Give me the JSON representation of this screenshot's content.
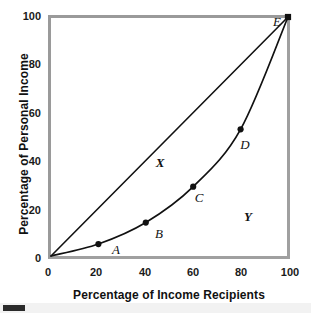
{
  "figure": {
    "background_color": "#ffffff",
    "frame_color": "#a0a0a0",
    "ink_color": "#111111"
  },
  "chart_data": {
    "type": "line",
    "title": "",
    "xlabel": "Percentage of Income Recipients",
    "ylabel": "Percentage of Personal Income",
    "xlim": [
      0,
      100
    ],
    "ylim": [
      0,
      100
    ],
    "xticks": [
      0,
      20,
      40,
      60,
      80,
      100
    ],
    "yticks": [
      0,
      20,
      40,
      60,
      80,
      100
    ],
    "xtick_labels": [
      "0",
      "20",
      "40",
      "60",
      "80",
      "100"
    ],
    "ytick_labels": [
      "0",
      "20",
      "40",
      "60",
      "80",
      "100"
    ],
    "grid": false,
    "legend": "none",
    "series": [
      {
        "name": "Line of equality",
        "style": "straight-line",
        "markers": false,
        "x": [
          0,
          100
        ],
        "y": [
          0,
          100
        ],
        "values": [
          0,
          100
        ]
      },
      {
        "name": "Lorenz curve",
        "style": "curve-with-markers",
        "markers": true,
        "x": [
          0,
          20,
          40,
          60,
          80,
          100
        ],
        "y": [
          0,
          5,
          14,
          29,
          53,
          100
        ],
        "values": [
          0,
          5,
          14,
          29,
          53,
          100
        ],
        "point_labels": [
          "",
          "A",
          "B",
          "C",
          "D",
          "E"
        ]
      }
    ],
    "points": [
      {
        "label": "A",
        "x": 20,
        "y": 5
      },
      {
        "label": "B",
        "x": 40,
        "y": 14
      },
      {
        "label": "C",
        "x": 60,
        "y": 29
      },
      {
        "label": "D",
        "x": 80,
        "y": 53
      },
      {
        "label": "E",
        "x": 100,
        "y": 100
      }
    ],
    "annotations": [
      {
        "text": "X",
        "x": 46,
        "y": 40,
        "description": "area between line of equality and Lorenz curve"
      },
      {
        "text": "Y",
        "x": 82,
        "y": 18,
        "description": "area below Lorenz curve"
      }
    ]
  },
  "labels": {
    "point_a": "A",
    "point_b": "B",
    "point_c": "C",
    "point_d": "D",
    "point_e": "E",
    "region_x": "X",
    "region_y": "Y"
  },
  "ticks": {
    "y": [
      "100",
      "80",
      "60",
      "40",
      "20",
      "0"
    ],
    "x": [
      "0",
      "20",
      "40",
      "60",
      "80",
      "100"
    ]
  },
  "axes": {
    "x_title": "Percentage of Income Recipients",
    "y_title": "Percentage of Personal Income"
  }
}
